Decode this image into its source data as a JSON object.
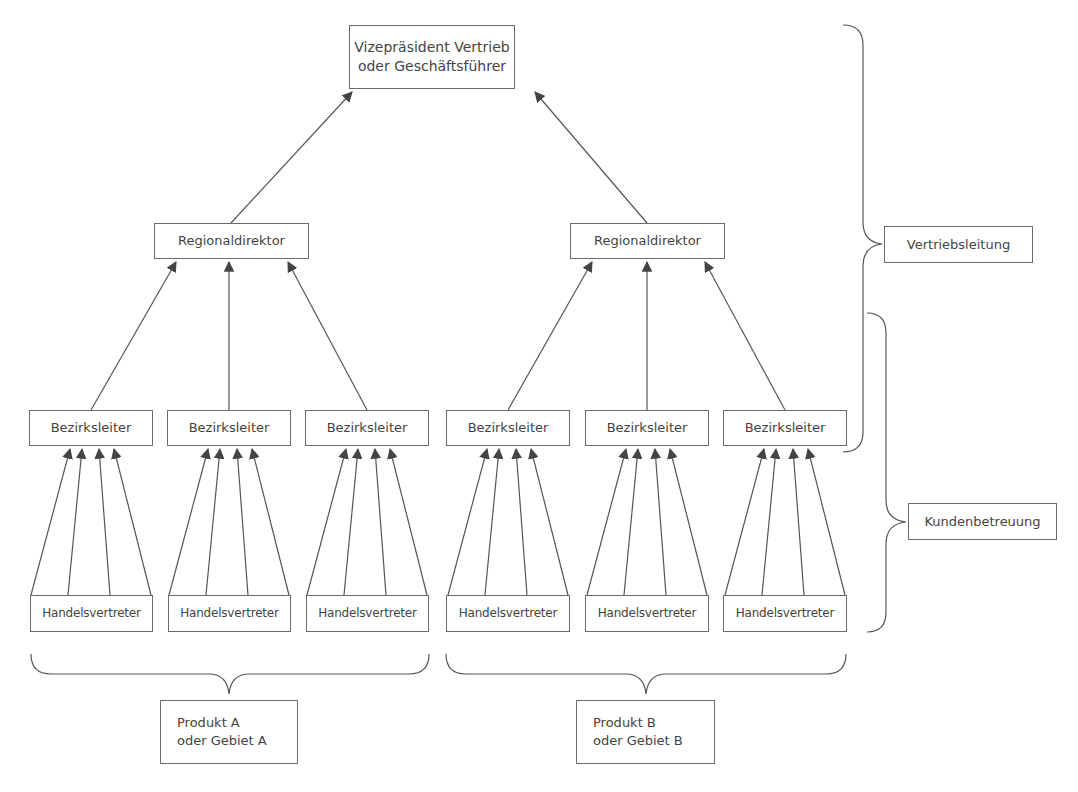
{
  "diagram": {
    "type": "org-chart",
    "top": {
      "label": "Vizepräsident Vertrieb\noder Geschäftsführer"
    },
    "regional": [
      {
        "label": "Regionaldirektor"
      },
      {
        "label": "Regionaldirektor"
      }
    ],
    "district": [
      {
        "label": "Bezirksleiter"
      },
      {
        "label": "Bezirksleiter"
      },
      {
        "label": "Bezirksleiter"
      },
      {
        "label": "Bezirksleiter"
      },
      {
        "label": "Bezirksleiter"
      },
      {
        "label": "Bezirksleiter"
      }
    ],
    "reps": [
      {
        "label": "Handelsvertreter"
      },
      {
        "label": "Handelsvertreter"
      },
      {
        "label": "Handelsvertreter"
      },
      {
        "label": "Handelsvertreter"
      },
      {
        "label": "Handelsvertreter"
      },
      {
        "label": "Handelsvertreter"
      }
    ],
    "right_brackets": {
      "management": "Vertriebsleitung",
      "customer_care": "Kundenbetreuung"
    },
    "bottom_groups": [
      {
        "label": "Produkt A\noder Gebiet A"
      },
      {
        "label": "Produkt B\noder Gebiet B"
      }
    ],
    "arrows_per_district": 4,
    "colors": {
      "line": "#555555",
      "box_border": "#6a6a6a",
      "text": "#444444"
    }
  }
}
